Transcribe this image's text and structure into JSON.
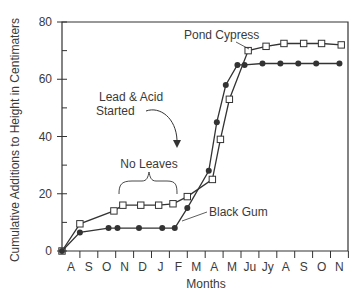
{
  "chart_data": {
    "type": "line",
    "title": "",
    "xlabel": "Months",
    "ylabel": "Cumulative Additions to Height in Centimaters",
    "ylim": [
      0,
      80
    ],
    "yticks": [
      0,
      20,
      40,
      60,
      80
    ],
    "grid": false,
    "categories": [
      "A",
      "S",
      "O",
      "N",
      "D",
      "J",
      "F",
      "M",
      "A",
      "M",
      "Ju",
      "Jy",
      "A",
      "S",
      "O",
      "N"
    ],
    "series": [
      {
        "name": "Pond Cypress",
        "marker": "open-square",
        "points": [
          {
            "x": 0.0,
            "y": 0
          },
          {
            "x": 1.0,
            "y": 9.5
          },
          {
            "x": 2.9,
            "y": 14
          },
          {
            "x": 3.4,
            "y": 16
          },
          {
            "x": 4.4,
            "y": 16
          },
          {
            "x": 5.4,
            "y": 16
          },
          {
            "x": 6.2,
            "y": 16.5
          },
          {
            "x": 7.0,
            "y": 19
          },
          {
            "x": 8.4,
            "y": 25
          },
          {
            "x": 8.85,
            "y": 39
          },
          {
            "x": 9.35,
            "y": 53
          },
          {
            "x": 10.4,
            "y": 70
          },
          {
            "x": 11.4,
            "y": 71.5
          },
          {
            "x": 12.4,
            "y": 72.5
          },
          {
            "x": 13.5,
            "y": 72.5
          },
          {
            "x": 14.5,
            "y": 72.5
          },
          {
            "x": 15.6,
            "y": 72
          }
        ]
      },
      {
        "name": "Black Gum",
        "marker": "filled-circle",
        "points": [
          {
            "x": 0.0,
            "y": 0
          },
          {
            "x": 1.0,
            "y": 6.5
          },
          {
            "x": 2.6,
            "y": 8
          },
          {
            "x": 3.1,
            "y": 8
          },
          {
            "x": 4.3,
            "y": 8
          },
          {
            "x": 5.6,
            "y": 8
          },
          {
            "x": 6.3,
            "y": 8
          },
          {
            "x": 7.0,
            "y": 15
          },
          {
            "x": 8.2,
            "y": 28
          },
          {
            "x": 8.65,
            "y": 45
          },
          {
            "x": 9.15,
            "y": 58
          },
          {
            "x": 9.8,
            "y": 65
          },
          {
            "x": 10.2,
            "y": 65
          },
          {
            "x": 11.2,
            "y": 65.5
          },
          {
            "x": 12.2,
            "y": 65.5
          },
          {
            "x": 13.2,
            "y": 65.5
          },
          {
            "x": 14.2,
            "y": 65.5
          },
          {
            "x": 15.5,
            "y": 65.5
          }
        ]
      }
    ],
    "annotations": [
      {
        "text": "Pond Cypress",
        "type": "series-label"
      },
      {
        "text": "Black Gum",
        "type": "series-label"
      },
      {
        "text": "Lead & Acid\nStarted",
        "type": "arrow-annotation"
      },
      {
        "text": "No Leaves",
        "type": "brace-annotation"
      }
    ],
    "legend": "none (inline labels)"
  },
  "labels": {
    "xlabel": "Months",
    "ylabel": "Cumulative Additions to Height in Centimaters",
    "pond_cypress": "Pond Cypress",
    "black_gum": "Black Gum",
    "lead_acid_line1": "Lead & Acid",
    "lead_acid_line2": "Started",
    "no_leaves": "No Leaves"
  },
  "colors": {
    "axis": "#333333",
    "line": "#333333",
    "text": "#3a3a3a"
  }
}
